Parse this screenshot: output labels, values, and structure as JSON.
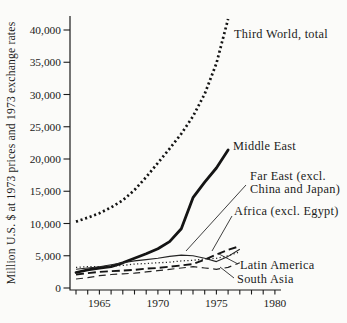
{
  "chart_data": {
    "type": "line",
    "title": "",
    "xlabel": "",
    "ylabel": "Million U.S. $ at 1973 prices and 1973 exchange rates",
    "ylim": [
      0,
      42000
    ],
    "xlim": [
      1962.5,
      1980.5
    ],
    "grid": false,
    "legend": "inline-labels-with-callouts",
    "yticks": [
      {
        "value": 40000,
        "label": "40,000"
      },
      {
        "value": 35000,
        "label": "35,000"
      },
      {
        "value": 30000,
        "label": "30,000"
      },
      {
        "value": 25000,
        "label": "25,000"
      },
      {
        "value": 20000,
        "label": "20,000"
      },
      {
        "value": 15000,
        "label": "15,000"
      },
      {
        "value": 10000,
        "label": "10,000"
      },
      {
        "value": 5000,
        "label": "5,000"
      },
      {
        "value": 0,
        "label": "0"
      }
    ],
    "xticks": [
      1963,
      1964,
      1965,
      1966,
      1967,
      1968,
      1969,
      1970,
      1971,
      1972,
      1973,
      1974,
      1975,
      1976,
      1977,
      1978,
      1979,
      1980
    ],
    "xtick_labels": [
      {
        "value": 1965,
        "label": "1965"
      },
      {
        "value": 1970,
        "label": "1970"
      },
      {
        "value": 1975,
        "label": "1975"
      },
      {
        "value": 1980,
        "label": "1980"
      }
    ],
    "x": [
      1963,
      1964,
      1965,
      1966,
      1967,
      1968,
      1969,
      1970,
      1971,
      1972,
      1973,
      1974,
      1975,
      1976,
      1977
    ],
    "series": [
      {
        "name": "Third World, total",
        "style": "bold-dotted",
        "label_lines": [
          "Third World, total"
        ],
        "label_pos": [
          234,
          38
        ],
        "callout": null,
        "values": [
          10300,
          10900,
          11600,
          12500,
          13600,
          15200,
          17200,
          19400,
          21600,
          23900,
          26600,
          30100,
          34800,
          41700,
          null
        ]
      },
      {
        "name": "Middle East",
        "style": "bold-solid",
        "label_lines": [
          "Middle East"
        ],
        "label_pos": [
          233,
          150
        ],
        "callout": null,
        "values": [
          2400,
          2800,
          3100,
          3300,
          3900,
          4600,
          5300,
          6100,
          7200,
          9200,
          14000,
          16400,
          18600,
          21400,
          null
        ]
      },
      {
        "name": "Far East (excl. China and Japan)",
        "style": "thin-solid",
        "label_lines": [
          "Far East (excl.",
          "China and Japan)"
        ],
        "label_pos": [
          250,
          180
        ],
        "callout": [
          246,
          185,
          186,
          251
        ],
        "values": [
          2900,
          3100,
          3300,
          3600,
          3900,
          4200,
          4400,
          4600,
          4900,
          5100,
          5000,
          4600,
          4100,
          4900,
          6000
        ]
      },
      {
        "name": "Africa (excl. Egypt)",
        "style": "bold-dashed",
        "label_lines": [
          "Africa (excl. Egypt)"
        ],
        "label_pos": [
          234,
          215
        ],
        "callout": [
          232,
          216,
          212,
          251
        ],
        "values": [
          2100,
          2300,
          2500,
          2600,
          2700,
          2800,
          3000,
          3100,
          3300,
          3500,
          3700,
          4400,
          5200,
          5900,
          6500
        ]
      },
      {
        "name": "Latin America",
        "style": "thin-dotted",
        "label_lines": [
          "Latin America"
        ],
        "label_pos": [
          240,
          269
        ],
        "callout": [
          238,
          264,
          219,
          254
        ],
        "values": [
          3200,
          3300,
          3300,
          3400,
          3500,
          3700,
          3800,
          3900,
          4000,
          4200,
          4300,
          4500,
          4600,
          5000,
          5600
        ]
      },
      {
        "name": "South Asia",
        "style": "thin-dashed",
        "label_lines": [
          "South Asia"
        ],
        "label_pos": [
          237,
          283
        ],
        "callout": [
          234,
          278,
          220,
          267
        ],
        "values": [
          1400,
          1600,
          1900,
          2100,
          2200,
          2300,
          2500,
          2700,
          2900,
          3100,
          3300,
          3100,
          2900,
          3200,
          3900
        ]
      }
    ]
  }
}
